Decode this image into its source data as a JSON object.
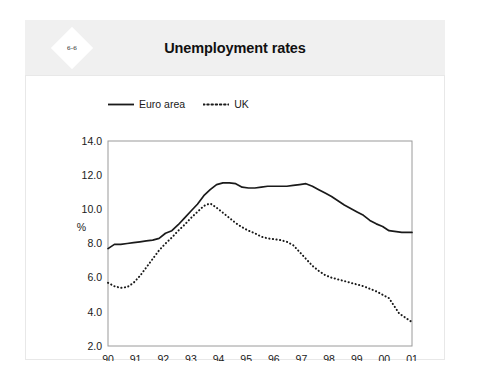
{
  "badge": {
    "label": "6-6"
  },
  "header": {
    "title": "Unemployment rates"
  },
  "legend": {
    "position": "top-left",
    "entries": [
      {
        "name": "Euro area",
        "style": "solid",
        "color": "#1a1a1a"
      },
      {
        "name": "UK",
        "style": "dotted",
        "color": "#1a1a1a"
      }
    ]
  },
  "chart_data": {
    "type": "line",
    "title": "Unemployment rates",
    "xlabel": "",
    "ylabel": "%",
    "ylim": [
      2.0,
      14.0
    ],
    "ytick_labels": [
      "14.0",
      "12.0",
      "10.0",
      "8.0",
      "6.0",
      "4.0",
      "2.0"
    ],
    "ytick_values": [
      14.0,
      12.0,
      10.0,
      8.0,
      6.0,
      4.0,
      2.0
    ],
    "grid": false,
    "legend_position": "above-plot-left",
    "x": [
      "90",
      "91",
      "92",
      "93",
      "94",
      "95",
      "96",
      "97",
      "98",
      "99",
      "00",
      "01"
    ],
    "xtick_labels": [
      "90",
      "91",
      "92",
      "93",
      "94",
      "95",
      "96",
      "97",
      "98",
      "99",
      "00",
      "01"
    ],
    "series": [
      {
        "name": "Euro area",
        "style": "solid",
        "color": "#1a1a1a",
        "points": [
          [
            90.0,
            7.7
          ],
          [
            90.25,
            7.95
          ],
          [
            90.5,
            7.95
          ],
          [
            90.75,
            8.0
          ],
          [
            91.0,
            8.05
          ],
          [
            91.25,
            8.1
          ],
          [
            91.5,
            8.15
          ],
          [
            91.75,
            8.2
          ],
          [
            92.0,
            8.3
          ],
          [
            92.25,
            8.6
          ],
          [
            92.5,
            8.75
          ],
          [
            92.75,
            9.1
          ],
          [
            93.0,
            9.5
          ],
          [
            93.25,
            9.9
          ],
          [
            93.5,
            10.3
          ],
          [
            93.75,
            10.8
          ],
          [
            94.0,
            11.15
          ],
          [
            94.25,
            11.45
          ],
          [
            94.5,
            11.55
          ],
          [
            94.75,
            11.55
          ],
          [
            95.0,
            11.5
          ],
          [
            95.25,
            11.3
          ],
          [
            95.5,
            11.25
          ],
          [
            95.75,
            11.25
          ],
          [
            96.0,
            11.3
          ],
          [
            96.25,
            11.35
          ],
          [
            96.5,
            11.35
          ],
          [
            96.75,
            11.35
          ],
          [
            97.0,
            11.35
          ],
          [
            97.25,
            11.4
          ],
          [
            97.5,
            11.45
          ],
          [
            97.75,
            11.5
          ],
          [
            98.0,
            11.35
          ],
          [
            98.25,
            11.15
          ],
          [
            98.5,
            10.95
          ],
          [
            98.75,
            10.75
          ],
          [
            99.0,
            10.5
          ],
          [
            99.25,
            10.25
          ],
          [
            99.5,
            10.05
          ],
          [
            99.75,
            9.85
          ],
          [
            100.0,
            9.65
          ],
          [
            100.25,
            9.35
          ],
          [
            100.5,
            9.15
          ],
          [
            100.75,
            9.0
          ],
          [
            101.0,
            8.75
          ],
          [
            101.5,
            8.65
          ],
          [
            101.9,
            8.65
          ]
        ]
      },
      {
        "name": "UK",
        "style": "dotted",
        "color": "#1a1a1a",
        "points": [
          [
            90.0,
            5.7
          ],
          [
            90.25,
            5.5
          ],
          [
            90.5,
            5.4
          ],
          [
            90.75,
            5.45
          ],
          [
            91.0,
            5.7
          ],
          [
            91.25,
            6.1
          ],
          [
            91.5,
            6.6
          ],
          [
            91.75,
            7.1
          ],
          [
            92.0,
            7.6
          ],
          [
            92.25,
            8.0
          ],
          [
            92.5,
            8.35
          ],
          [
            92.75,
            8.75
          ],
          [
            93.0,
            9.1
          ],
          [
            93.25,
            9.5
          ],
          [
            93.5,
            9.85
          ],
          [
            93.75,
            10.2
          ],
          [
            94.0,
            10.35
          ],
          [
            94.25,
            10.1
          ],
          [
            94.5,
            9.8
          ],
          [
            94.75,
            9.5
          ],
          [
            95.0,
            9.2
          ],
          [
            95.25,
            8.95
          ],
          [
            95.5,
            8.75
          ],
          [
            95.75,
            8.6
          ],
          [
            96.0,
            8.4
          ],
          [
            96.25,
            8.3
          ],
          [
            96.5,
            8.25
          ],
          [
            96.75,
            8.2
          ],
          [
            97.0,
            8.1
          ],
          [
            97.25,
            7.9
          ],
          [
            97.5,
            7.5
          ],
          [
            97.75,
            7.1
          ],
          [
            98.0,
            6.7
          ],
          [
            98.25,
            6.4
          ],
          [
            98.5,
            6.15
          ],
          [
            98.75,
            6.0
          ],
          [
            99.0,
            5.9
          ],
          [
            99.25,
            5.8
          ],
          [
            99.5,
            5.7
          ],
          [
            99.75,
            5.6
          ],
          [
            100.0,
            5.5
          ],
          [
            100.25,
            5.35
          ],
          [
            100.5,
            5.2
          ],
          [
            100.75,
            5.0
          ],
          [
            101.0,
            4.8
          ],
          [
            101.4,
            3.9
          ],
          [
            101.9,
            3.4
          ]
        ]
      }
    ]
  },
  "axes": {
    "x_domain": [
      90.0,
      101.9
    ],
    "y_domain": [
      2.0,
      14.0
    ]
  }
}
